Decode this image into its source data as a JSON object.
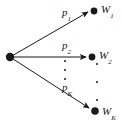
{
  "diagram": {
    "type": "probability-branching-tree",
    "source_node": {
      "name": "source",
      "x": 10,
      "y": 57
    },
    "stroke_color": "#1a1a1a",
    "background_color": "#ffffff",
    "branches": [
      {
        "edge_label_base": "p",
        "edge_label_sub": "1",
        "node_label_base": "W",
        "node_label_sub": "1",
        "node_x": 94,
        "node_y": 11,
        "edge_label_x": 62,
        "edge_label_y": 7,
        "node_label_x": 101,
        "node_label_y": 4
      },
      {
        "edge_label_base": "p",
        "edge_label_sub": "2",
        "node_label_base": "W",
        "node_label_sub": "2",
        "node_x": 92,
        "node_y": 57,
        "edge_label_x": 62,
        "edge_label_y": 40,
        "node_label_x": 99,
        "node_label_y": 50
      },
      {
        "edge_label_base": "p",
        "edge_label_sub": "K",
        "node_label_base": "W",
        "node_label_sub": "K",
        "node_x": 95,
        "node_y": 111,
        "edge_label_x": 62,
        "edge_label_y": 82,
        "node_label_x": 102,
        "node_label_y": 106
      }
    ],
    "ellipsis": [
      {
        "name": "edge-ellipsis",
        "x": 65,
        "y": 62,
        "dots": 3,
        "spacing": "narrow"
      },
      {
        "name": "node-ellipsis",
        "x": 97,
        "y": 64,
        "dots": 3,
        "spacing": "wide"
      }
    ]
  }
}
